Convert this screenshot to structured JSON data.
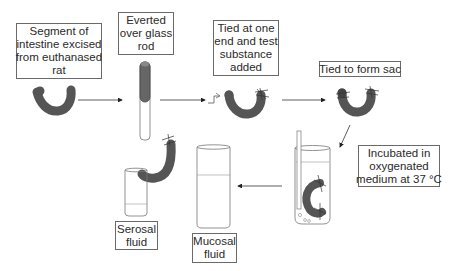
{
  "diagram": {
    "steps": [
      {
        "id": "step1",
        "lines": [
          "Segment of",
          "intestine excised",
          "from euthanased",
          "rat"
        ]
      },
      {
        "id": "step2",
        "lines": [
          "Everted",
          "over glass",
          "rod"
        ]
      },
      {
        "id": "step3",
        "lines": [
          "Tied at one",
          "end and test",
          "substance",
          "added"
        ]
      },
      {
        "id": "step4",
        "lines": [
          "Tied to form sac"
        ]
      },
      {
        "id": "step5",
        "lines": [
          "Incubated in",
          "oxygenated",
          "medium at 37 °C"
        ]
      }
    ],
    "outputs": [
      {
        "id": "serosal",
        "lines": [
          "Serosal",
          "fluid"
        ]
      },
      {
        "id": "mucosal",
        "lines": [
          "Mucosal",
          "fluid"
        ]
      }
    ],
    "colors": {
      "line": "#333333",
      "box_border": "#6a6a6a",
      "tissue": "#555555",
      "glass": "#777777"
    }
  }
}
